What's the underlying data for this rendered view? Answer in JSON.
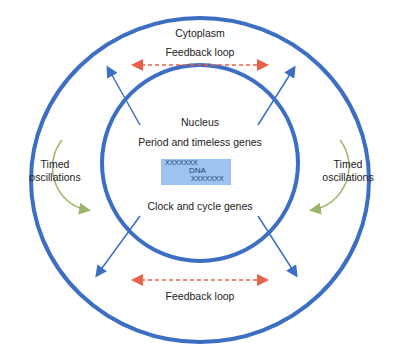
{
  "diagram": {
    "outer_label": "Cytoplasm",
    "inner_label": "Nucleus",
    "feedback_top": "Feedback loop",
    "feedback_bottom": "Feedback loop",
    "genes_top": "Period and timeless genes",
    "genes_bottom": "Clock and cycle genes",
    "dna": {
      "strand_top": "XXXXXXX",
      "label": "DNA",
      "strand_bottom": "XXXXXXX"
    },
    "left_osc": {
      "line1": "Timed",
      "line2": "oscillations"
    },
    "right_osc": {
      "line1": "Timed",
      "line2": "oscillations"
    },
    "colors": {
      "circle": "#3c6fc4",
      "feedback_arrow": "#e8604a",
      "oscillation_arrow": "#9bb56a",
      "dna_box": "#9ec3f0"
    }
  }
}
